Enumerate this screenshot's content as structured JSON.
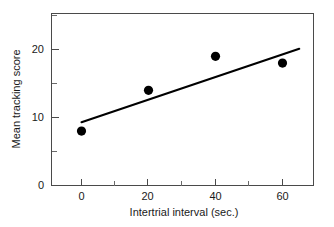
{
  "chart_data": {
    "type": "scatter",
    "title": "",
    "subtitle": "",
    "xlabel": "Intertrial interval (sec.)",
    "ylabel": "Mean tracking score",
    "x": [
      0,
      20,
      40,
      60
    ],
    "values": [
      8,
      14,
      19,
      18
    ],
    "series": [
      {
        "name": "Mean tracking score",
        "x": [
          0,
          20,
          40,
          60
        ],
        "values": [
          8,
          14,
          19,
          18
        ],
        "marker": "filled-circle",
        "color": "#000000"
      },
      {
        "name": "regression line",
        "type": "line",
        "x": [
          0,
          65
        ],
        "values": [
          9.3,
          20.1
        ],
        "color": "#000000"
      }
    ],
    "xlim": [
      -9,
      71
    ],
    "ylim": [
      0,
      25.3
    ],
    "xticks": [
      0,
      20,
      40,
      60
    ],
    "xticklabels": [
      "0",
      "20",
      "40",
      "60"
    ],
    "xticks_minor": [
      10,
      30,
      50
    ],
    "yticks": [
      0,
      10,
      20
    ],
    "yticklabels": [
      "0",
      "10",
      "20"
    ],
    "yticks_minor": [
      5,
      15,
      25
    ],
    "grid": false,
    "legend": false,
    "legend_position": "none",
    "annotations": [],
    "colors": {
      "marker": "#000000",
      "line": "#000000",
      "axis": "#4a4a4a",
      "text": "#1a1a1a",
      "background": "#ffffff"
    }
  },
  "axes": {
    "x_title": "Intertrial interval (sec.)",
    "y_title": "Mean tracking score",
    "x_tick_0": "0",
    "x_tick_1": "20",
    "x_tick_2": "40",
    "x_tick_3": "60",
    "y_tick_0": "0",
    "y_tick_1": "10",
    "y_tick_2": "20"
  }
}
